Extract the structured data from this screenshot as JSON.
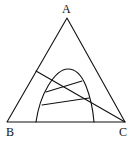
{
  "diagram": {
    "type": "ternary-phase-diagram",
    "vertices": {
      "top": "A",
      "bottom_left": "B",
      "bottom_right": "C"
    },
    "colors": {
      "stroke": "#111111",
      "background": "#ffffff"
    }
  }
}
